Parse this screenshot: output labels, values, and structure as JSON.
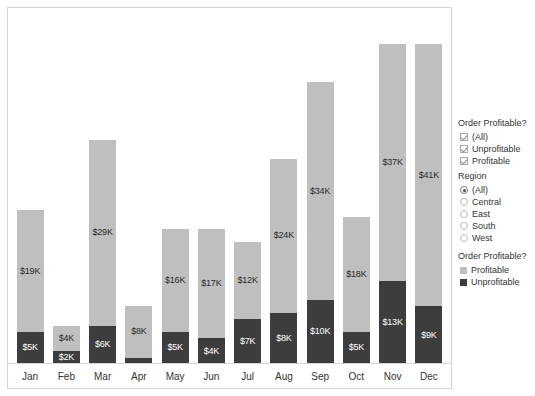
{
  "chart_data": {
    "type": "bar",
    "title": "",
    "xlabel": "",
    "ylabel": "",
    "stacked": true,
    "grid": false,
    "ylim": [
      0,
      54
    ],
    "units": "thousands of dollars",
    "categories": [
      "Jan",
      "Feb",
      "Mar",
      "Apr",
      "May",
      "Jun",
      "Jul",
      "Aug",
      "Sep",
      "Oct",
      "Nov",
      "Dec"
    ],
    "series": [
      {
        "name": "Profitable",
        "color": "#bfbfbf",
        "values": [
          19,
          4,
          29,
          8,
          16,
          17,
          12,
          24,
          34,
          18,
          37,
          41
        ],
        "labels": [
          "$19K",
          "$4K",
          "$29K",
          "$8K",
          "$16K",
          "$17K",
          "$12K",
          "$24K",
          "$34K",
          "$18K",
          "$37K",
          "$41K"
        ]
      },
      {
        "name": "Unprofitable",
        "color": "#3d3d3d",
        "values": [
          5,
          2,
          6,
          1,
          5,
          4,
          7,
          8,
          10,
          5,
          13,
          9
        ],
        "labels": [
          "$5K",
          "$2K",
          "$6K",
          "",
          "$5K",
          "$4K",
          "$7K",
          "$8K",
          "$10K",
          "$5K",
          "$13K",
          "$9K"
        ]
      }
    ]
  },
  "filters": {
    "order_profitable": {
      "title": "Order Profitable?",
      "options": [
        {
          "label": "(All)",
          "checked": true
        },
        {
          "label": "Unprofitable",
          "checked": true
        },
        {
          "label": "Profitable",
          "checked": true
        }
      ]
    },
    "region": {
      "title": "Region",
      "options": [
        {
          "label": "(All)",
          "selected": true
        },
        {
          "label": "Central",
          "selected": false
        },
        {
          "label": "East",
          "selected": false
        },
        {
          "label": "South",
          "selected": false
        },
        {
          "label": "West",
          "selected": false
        }
      ]
    }
  },
  "legend": {
    "title": "Order Profitable?",
    "entries": [
      {
        "label": "Profitable",
        "color": "#bfbfbf"
      },
      {
        "label": "Unprofitable",
        "color": "#3d3d3d"
      }
    ]
  }
}
